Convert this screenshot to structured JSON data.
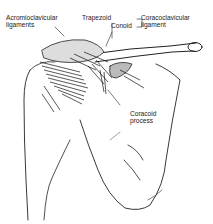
{
  "figure": {
    "labels": {
      "acromioclavicular": {
        "line1": "Acromioclavicular",
        "line2": "ligaments"
      },
      "trapezoid": "Trapezoid",
      "conoid": "Conoid",
      "coracoclavicular": {
        "line1": "Coracoclavicular",
        "line2": "ligament"
      },
      "coracoid_process": {
        "line1": "Coracoid",
        "line2": "process"
      }
    },
    "colors": {
      "ink": "#222222",
      "background": "#ffffff"
    }
  }
}
